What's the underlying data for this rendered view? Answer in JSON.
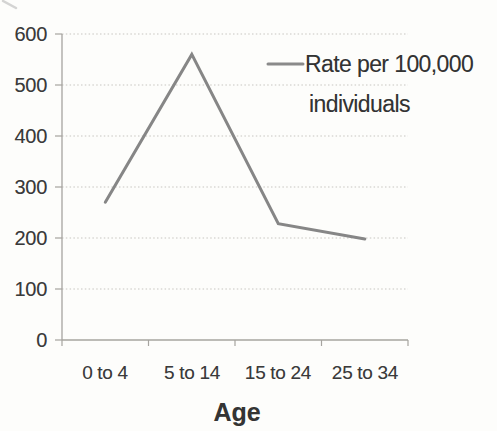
{
  "chart_data": {
    "type": "line",
    "title": "",
    "xlabel": "Age",
    "ylabel": "",
    "categories": [
      "0 to 4",
      "5 to 14",
      "15 to 24",
      "25 to 34"
    ],
    "series": [
      {
        "name": "Rate per 100,000 individuals",
        "values": [
          270,
          560,
          228,
          198
        ]
      }
    ],
    "ylim": [
      0,
      600
    ],
    "ytick_step": 100,
    "ytick_labels": [
      "0",
      "100",
      "200",
      "300",
      "400",
      "500",
      "600"
    ],
    "grid": true,
    "legend": {
      "position": "top-right",
      "line1": "Rate per 100,000",
      "line2": "individuals"
    }
  },
  "colors": {
    "series_line": "#868686",
    "legend_marker": "#8a8a8a",
    "gridline": "#c8c6c1",
    "axis": "#a6a49f",
    "text": "#3a3a3a",
    "background": "#fdfdfb"
  }
}
